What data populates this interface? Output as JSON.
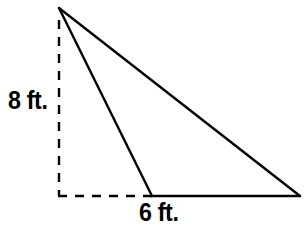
{
  "figure": {
    "type": "geometry-diagram",
    "background_color": "#ffffff",
    "stroke_color": "#000000",
    "stroke_width": 2.4
  },
  "labels": {
    "height": "8 ft.",
    "base": "6 ft."
  },
  "measurements": {
    "height_value": 8,
    "height_unit": "ft.",
    "base_value": 6,
    "base_unit": "ft."
  },
  "geometry": {
    "apex": {
      "x": 59,
      "y": 8
    },
    "corner": {
      "x": 59,
      "y": 196
    },
    "base_left": {
      "x": 152,
      "y": 196
    },
    "base_right": {
      "x": 300,
      "y": 196
    },
    "height_dash_top": {
      "x": 59,
      "y": 20
    },
    "dash_pattern": "9,8"
  }
}
